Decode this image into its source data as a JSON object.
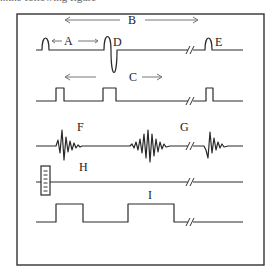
{
  "caption": "...the following figure",
  "figure": {
    "labels": {
      "A": "A",
      "B": "B",
      "C": "C",
      "D": "D",
      "E": "E",
      "F": "F",
      "G": "G",
      "H": "H",
      "I": "I"
    },
    "rows": [
      {
        "id": "row-1",
        "description": "baseline with narrow positive spike, biphasic spike D, break, spike E",
        "labels": [
          "A",
          "B",
          "D",
          "E"
        ]
      },
      {
        "id": "row-2",
        "description": "square pulse train with break",
        "labels": [
          "C"
        ]
      },
      {
        "id": "row-3",
        "description": "damped oscillation bursts F and G with break",
        "labels": [
          "F",
          "G"
        ]
      },
      {
        "id": "row-4",
        "description": "flat baseline with calibration/marker box H and break",
        "labels": [
          "H"
        ]
      },
      {
        "id": "row-5",
        "description": "wide square pulses with break",
        "labels": [
          "I"
        ]
      }
    ],
    "colors": {
      "line": "#2a2a2a",
      "arrow": "#777777",
      "frame": "#333333"
    }
  }
}
